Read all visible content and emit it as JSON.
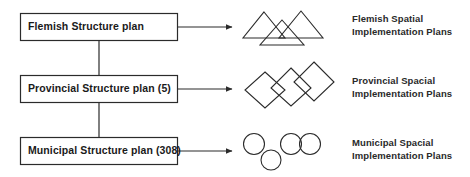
{
  "diagram": {
    "background_color": "#ffffff",
    "stroke_color": "#2b2b2b",
    "text_color": "#1a1a1a",
    "boxes": [
      {
        "id": "flemish",
        "label": "Flemish Structure plan"
      },
      {
        "id": "provincial",
        "label": "Provincial Structure plan (5)"
      },
      {
        "id": "municipal",
        "label": "Municipal Structure plan (308)"
      }
    ],
    "rows": [
      {
        "id": "flemish",
        "icon": "three-triangles-icon",
        "label_line1": "Flemish Spatial",
        "label_line2": "Implementation Plans"
      },
      {
        "id": "provincial",
        "icon": "three-diamonds-icon",
        "label_line1": "Provincial Spacial",
        "label_line2": "Implementation Plans"
      },
      {
        "id": "municipal",
        "icon": "four-circles-icon",
        "label_line1": "Municipal Spacial",
        "label_line2": "Implementation Plans"
      }
    ],
    "connectors": {
      "vertical_count": 2,
      "arrow_count": 3,
      "arrow_style": "solid-triangle-head"
    }
  }
}
